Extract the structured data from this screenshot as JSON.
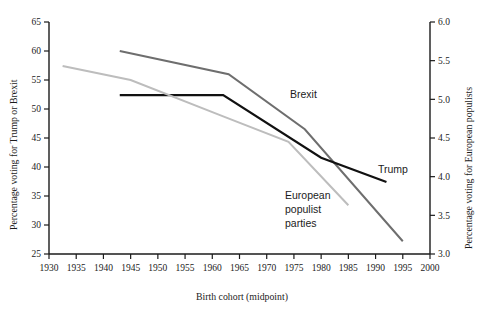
{
  "chart_data": {
    "type": "line",
    "title": "",
    "xlabel": "Birth cohort (midpoint)",
    "ylabel": "Percentage voting for Trump or Brexit",
    "y2label": "Percentage voting for European populists",
    "xlim": [
      1930,
      2000
    ],
    "ylim": [
      25,
      65
    ],
    "y2lim": [
      3.0,
      6.0
    ],
    "xticks": [
      1930,
      1935,
      1940,
      1945,
      1950,
      1955,
      1960,
      1965,
      1970,
      1975,
      1980,
      1985,
      1990,
      1995,
      2000
    ],
    "xticklabels": [
      "1930",
      "1935",
      "1940",
      "1945",
      "1950",
      "1955",
      "1960",
      "1965",
      "1970",
      "1975",
      "1980",
      "1985",
      "1990",
      "1995",
      "2000"
    ],
    "yticks": [
      25,
      30,
      35,
      40,
      45,
      50,
      55,
      60,
      65
    ],
    "yticklabels": [
      "25",
      "30",
      "35",
      "40",
      "45",
      "50",
      "55",
      "60",
      "65"
    ],
    "y2ticks": [
      3.0,
      3.5,
      4.0,
      4.5,
      5.0,
      5.5,
      6.0
    ],
    "y2ticklabels": [
      "3.0",
      "3.5",
      "4.0",
      "4.5",
      "5.0",
      "5.5",
      "6.0"
    ],
    "grid": false,
    "legend_position": "inline-annotations",
    "series": [
      {
        "name": "Brexit",
        "axis": "left",
        "color": "#6e6e6e",
        "width": 2.0,
        "label_x": 1970,
        "label_y": 51.5,
        "x": [
          1943,
          1963,
          1977,
          1995
        ],
        "values": [
          60.0,
          56.0,
          46.5,
          27.2
        ]
      },
      {
        "name": "Trump",
        "axis": "left",
        "color": "#111111",
        "width": 2.2,
        "label_x": 1992,
        "label_y": 41.0,
        "x": [
          1943,
          1962,
          1980,
          1992
        ],
        "values": [
          52.4,
          52.4,
          41.6,
          37.4
        ]
      },
      {
        "name": "European populist parties",
        "axis": "right",
        "color": "#bdbdbd",
        "width": 2.0,
        "label_x": 1971,
        "label_y": 34.5,
        "x": [
          1932.5,
          1945,
          1962,
          1974,
          1985
        ],
        "values": [
          5.43,
          5.25,
          4.78,
          4.45,
          3.63
        ]
      }
    ]
  },
  "annotations": {
    "brexit_label": "Brexit",
    "trump_label": "Trump",
    "populist_label_line1": "European",
    "populist_label_line2": "populist",
    "populist_label_line3": "parties"
  },
  "axes": {
    "left_title": "Percentage voting for Trump or Brexit",
    "right_title": "Percentage voting for European populists",
    "bottom_title": "Birth cohort (midpoint)"
  },
  "colors": {
    "background": "#ffffff",
    "axis": "#1b1b1b",
    "brexit": "#6e6e6e",
    "trump": "#111111",
    "populist": "#bdbdbd"
  }
}
